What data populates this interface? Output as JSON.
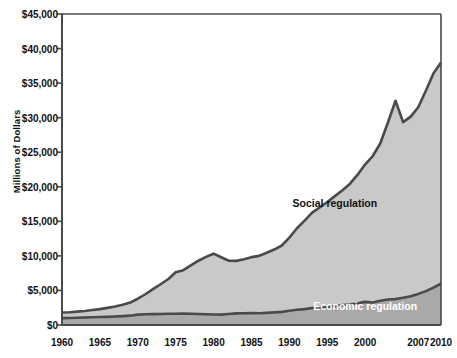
{
  "chart_data": {
    "type": "area",
    "stacked": true,
    "title": "",
    "xlabel": "",
    "ylabel": "Millions of Dollars",
    "xlim": [
      1960,
      2010
    ],
    "ylim": [
      0,
      45000
    ],
    "ytick_values": [
      0,
      5000,
      10000,
      15000,
      20000,
      25000,
      30000,
      35000,
      40000,
      45000
    ],
    "ytick_labels": [
      "$0",
      "$5,000",
      "$10,000",
      "$15,000",
      "$20,000",
      "$25,000",
      "$30,000",
      "$35,000",
      "$40,000",
      "$45,000"
    ],
    "xtick_labels": [
      "1960",
      "1965",
      "1970",
      "1975",
      "1980",
      "1985",
      "1990",
      "1995",
      "2000",
      "2007",
      "2010"
    ],
    "xtick_values": [
      1960,
      1965,
      1970,
      1975,
      1980,
      1985,
      1990,
      1995,
      2000,
      2007,
      2010
    ],
    "grid": false,
    "legend_position": "inline-annotation",
    "annotations": [
      {
        "text": "Social regulation",
        "x": 1996,
        "y": 17500,
        "color": "#111111"
      },
      {
        "text": "Economic regulation",
        "x": 2000,
        "y": 2600,
        "color": "#ffffff"
      }
    ],
    "colors": {
      "economic_fill": "#a9a9a9",
      "social_fill": "#c9c9c9",
      "line": "#4a4a4a",
      "axis": "#4a4a4a",
      "background": "#ffffff",
      "text": "#111111"
    },
    "x": [
      1960,
      1961,
      1962,
      1963,
      1964,
      1965,
      1966,
      1967,
      1968,
      1969,
      1970,
      1971,
      1972,
      1973,
      1974,
      1975,
      1976,
      1977,
      1978,
      1979,
      1980,
      1981,
      1982,
      1983,
      1984,
      1985,
      1986,
      1987,
      1988,
      1989,
      1990,
      1991,
      1992,
      1993,
      1994,
      1995,
      1996,
      1997,
      1998,
      1999,
      2000,
      2001,
      2002,
      2003,
      2004,
      2005,
      2006,
      2007,
      2008,
      2009,
      2010
    ],
    "series": [
      {
        "name": "Economic regulation",
        "values": [
          1000,
          1020,
          1050,
          1080,
          1120,
          1150,
          1180,
          1220,
          1280,
          1350,
          1500,
          1550,
          1580,
          1600,
          1620,
          1630,
          1640,
          1630,
          1600,
          1560,
          1520,
          1500,
          1600,
          1680,
          1700,
          1720,
          1700,
          1750,
          1820,
          1900,
          2050,
          2200,
          2300,
          2450,
          2500,
          2600,
          2750,
          2900,
          2950,
          3150,
          3350,
          3250,
          3500,
          3700,
          3750,
          3950,
          4150,
          4500,
          4900,
          5400,
          6000
        ]
      },
      {
        "name": "Social regulation",
        "values": [
          800,
          830,
          880,
          950,
          1050,
          1150,
          1300,
          1450,
          1650,
          1900,
          2300,
          2900,
          3600,
          4300,
          5000,
          6000,
          6300,
          7000,
          7700,
          8300,
          8800,
          8300,
          7700,
          7600,
          7800,
          8100,
          8300,
          8700,
          9100,
          9600,
          10600,
          11800,
          12800,
          13800,
          14500,
          15200,
          15900,
          16600,
          17500,
          18600,
          19900,
          21200,
          22800,
          25600,
          28700,
          25400,
          26000,
          27000,
          29000,
          31000,
          32000
        ]
      }
    ],
    "totals": [
      1800,
      1850,
      1930,
      2030,
      2170,
      2300,
      2480,
      2670,
      2930,
      3250,
      3800,
      4450,
      5180,
      5900,
      6620,
      7630,
      7940,
      8630,
      9300,
      9860,
      10320,
      9800,
      9300,
      9280,
      9500,
      9820,
      10000,
      10450,
      10920,
      11500,
      12650,
      14000,
      15100,
      16250,
      17000,
      17800,
      18650,
      19500,
      20450,
      21750,
      23250,
      24450,
      26300,
      29300,
      32450,
      29350,
      30150,
      31500,
      33900,
      36400,
      38000
    ]
  }
}
